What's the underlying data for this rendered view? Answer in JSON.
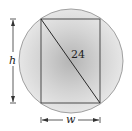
{
  "diagram": {
    "type": "inscribed-rectangle-in-circle",
    "diagonal_label": "24",
    "height_label": "h",
    "width_label": "w",
    "colors": {
      "circle_fill_center": "#b8b8b8",
      "circle_fill_edge": "#e4e4e4",
      "circle_stroke": "#9a9a9a",
      "line": "#333333"
    }
  }
}
